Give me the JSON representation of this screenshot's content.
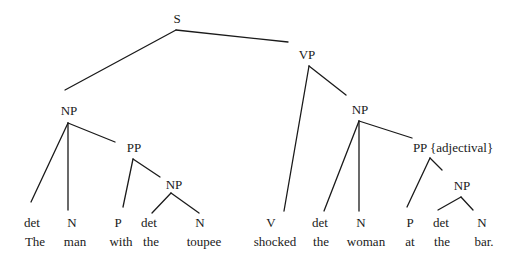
{
  "diagram": {
    "type": "syntax-tree",
    "sentence": "The man with the toupee shocked the woman at the bar.",
    "nodes": {
      "s": "S",
      "vp": "VP",
      "np_subject": "NP",
      "pp_subject": "PP",
      "np_toupee": "NP",
      "np_object": "NP",
      "pp_object": "PP {adjectival}",
      "np_bar": "NP"
    },
    "leaves": [
      {
        "category": "det",
        "word": "The"
      },
      {
        "category": "N",
        "word": "man"
      },
      {
        "category": "P",
        "word": "with"
      },
      {
        "category": "det",
        "word": "the"
      },
      {
        "category": "N",
        "word": "toupee"
      },
      {
        "category": "V",
        "word": "shocked"
      },
      {
        "category": "det",
        "word": "the"
      },
      {
        "category": "N",
        "word": "woman"
      },
      {
        "category": "P",
        "word": "at"
      },
      {
        "category": "det",
        "word": "the"
      },
      {
        "category": "N",
        "word": "bar."
      }
    ],
    "edges": [
      [
        "S",
        "NP"
      ],
      [
        "S",
        "VP"
      ],
      [
        "NP",
        "det"
      ],
      [
        "NP",
        "N"
      ],
      [
        "NP",
        "PP"
      ],
      [
        "PP",
        "P"
      ],
      [
        "PP",
        "NP"
      ],
      [
        "NP",
        "det"
      ],
      [
        "NP",
        "N"
      ],
      [
        "VP",
        "V"
      ],
      [
        "VP",
        "NP"
      ],
      [
        "NP",
        "det"
      ],
      [
        "NP",
        "N"
      ],
      [
        "NP",
        "PP {adjectival}"
      ],
      [
        "PP {adjectival}",
        "P"
      ],
      [
        "PP {adjectival}",
        "NP"
      ],
      [
        "NP",
        "det"
      ],
      [
        "NP",
        "N"
      ]
    ],
    "line_color": "#1a1a1a"
  }
}
